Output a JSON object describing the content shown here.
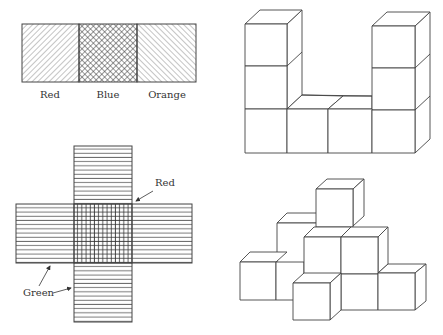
{
  "figure": {
    "panel_top_left": {
      "description": "Three-square colored strip",
      "labels": [
        "Red",
        "Blue",
        "Orange"
      ]
    },
    "panel_bottom_left": {
      "description": "Cross-shaped net with striped regions",
      "labels": {
        "red": "Red",
        "green": "Green"
      }
    },
    "panel_top_right": {
      "description": "U-shaped cube arrangement"
    },
    "panel_bottom_right": {
      "description": "Stepped pyramid cube arrangement"
    }
  }
}
